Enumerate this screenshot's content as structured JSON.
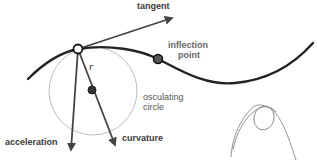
{
  "diagram": {
    "labels": {
      "tangent": "tangent",
      "inflection_line1": "inflection",
      "inflection_line2": "point",
      "radius": "r",
      "osculating_line1": "osculating",
      "osculating_line2": "circle",
      "acceleration": "acceleration",
      "curvature": "curvature"
    },
    "colors": {
      "curve": "#222222",
      "vector": "#444444",
      "circle": "#bbbbbb",
      "sketch": "#888888",
      "text": "#3a3a3a"
    },
    "points": {
      "contact_point": {
        "x": 78,
        "y": 49,
        "style": "open"
      },
      "inflection_point": {
        "x": 158,
        "y": 59,
        "style": "filled"
      },
      "circle_center": {
        "x": 93,
        "y": 91,
        "style": "filled"
      }
    },
    "osculating_circle": {
      "cx": 93,
      "cy": 91,
      "r": 44
    }
  }
}
